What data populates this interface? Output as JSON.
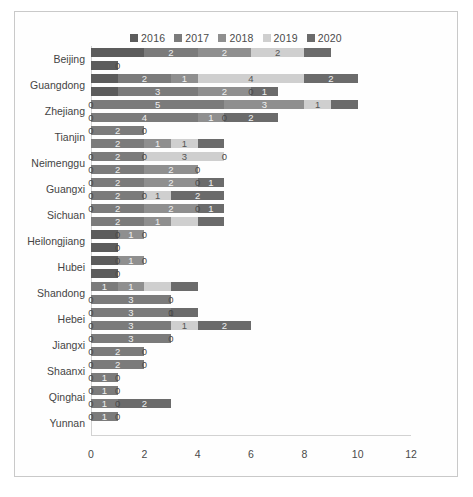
{
  "chart": {
    "type": "bar",
    "orientation": "horizontal",
    "stacked": true,
    "title": "",
    "xlabel": "",
    "ylabel": "",
    "xlim": [
      0,
      12
    ],
    "xticks": [
      0,
      2,
      4,
      6,
      8,
      10,
      12
    ],
    "grid": false,
    "legend_position": "top-center",
    "bars_per_group": 2,
    "value_label_zero_shown": true
  },
  "legend": {
    "items": [
      {
        "label": "2016",
        "color": "#5c5c5c"
      },
      {
        "label": "2017",
        "color": "#7b7b7b"
      },
      {
        "label": "2018",
        "color": "#8f8f8f"
      },
      {
        "label": "2019",
        "color": "#cfcfcf"
      },
      {
        "label": "2020",
        "color": "#6b6b6b"
      }
    ]
  },
  "series_colors": [
    "#5c5c5c",
    "#7b7b7b",
    "#8f8f8f",
    "#cfcfcf",
    "#6b6b6b"
  ],
  "series_names": [
    "2016",
    "2017",
    "2018",
    "2019",
    "2020"
  ],
  "chart_data": {
    "type": "bar",
    "orientation": "horizontal",
    "stacked": true,
    "title": "",
    "xlabel": "",
    "ylabel": "",
    "xlim": [
      0,
      12
    ],
    "xticks": [
      0,
      2,
      4,
      6,
      8,
      10,
      12
    ],
    "grid": false,
    "legend": [
      "2016",
      "2017",
      "2018",
      "2019",
      "2020"
    ],
    "categories": [
      "Beijing",
      "Guangdong",
      "Zhejiang",
      "Tianjin",
      "Neimenggu",
      "Guangxi",
      "Sichuan",
      "Heilongjiang",
      "Hubei",
      "Shandong",
      "Hebei",
      "Jiangxi",
      "Shaanxi",
      "Qinghai",
      "Yunnan"
    ],
    "groups": [
      {
        "category": "Beijing",
        "bars": [
          {
            "values": [
              2,
              2,
              2,
              2,
              1
            ],
            "labels": [
              "",
              "2",
              "2",
              "2",
              ""
            ],
            "total": 9
          },
          {
            "values": [
              1,
              0,
              0,
              0,
              0
            ],
            "labels": [
              "",
              "0",
              "",
              "",
              ""
            ],
            "total": 1
          }
        ]
      },
      {
        "category": "Guangdong",
        "bars": [
          {
            "values": [
              1,
              2,
              1,
              4,
              2
            ],
            "labels": [
              "",
              "2",
              "1",
              "4",
              "2"
            ],
            "total": 10
          },
          {
            "values": [
              1,
              3,
              2,
              0,
              1
            ],
            "labels": [
              "",
              "3",
              "2",
              "0",
              "1"
            ],
            "total": 7
          }
        ]
      },
      {
        "category": "Zhejiang",
        "bars": [
          {
            "values": [
              0,
              5,
              3,
              1,
              1
            ],
            "labels": [
              "0",
              "5",
              "3",
              "1",
              ""
            ],
            "total": 10
          },
          {
            "values": [
              0,
              4,
              1,
              0,
              2
            ],
            "labels": [
              "0",
              "4",
              "1",
              "0",
              "2"
            ],
            "total": 7
          }
        ]
      },
      {
        "category": "Tianjin",
        "bars": [
          {
            "values": [
              0,
              2,
              0,
              0,
              0
            ],
            "labels": [
              "0",
              "2",
              "0",
              "",
              ""
            ],
            "total": 2
          },
          {
            "values": [
              0,
              2,
              1,
              1,
              1
            ],
            "labels": [
              "",
              "2",
              "1",
              "1",
              ""
            ],
            "total": 5
          }
        ]
      },
      {
        "category": "Neimenggu",
        "bars": [
          {
            "values": [
              0,
              2,
              0,
              3,
              0
            ],
            "labels": [
              "0",
              "2",
              "0",
              "3",
              "0"
            ],
            "total": 5
          },
          {
            "values": [
              0,
              2,
              2,
              0,
              0
            ],
            "labels": [
              "0",
              "2",
              "2",
              "0",
              ""
            ],
            "total": 4
          }
        ]
      },
      {
        "category": "Guangxi",
        "bars": [
          {
            "values": [
              0,
              2,
              2,
              0,
              1
            ],
            "labels": [
              "0",
              "2",
              "2",
              "0",
              "1"
            ],
            "total": 5
          },
          {
            "values": [
              0,
              2,
              0,
              1,
              2
            ],
            "labels": [
              "0",
              "2",
              "0",
              "1",
              "2"
            ],
            "total": 5
          }
        ]
      },
      {
        "category": "Sichuan",
        "bars": [
          {
            "values": [
              0,
              2,
              2,
              0,
              1
            ],
            "labels": [
              "0",
              "2",
              "2",
              "0",
              "1"
            ],
            "total": 5
          },
          {
            "values": [
              0,
              2,
              1,
              1,
              1
            ],
            "labels": [
              "",
              "2",
              "1",
              "",
              ""
            ],
            "total": 5
          }
        ]
      },
      {
        "category": "Heilongjiang",
        "bars": [
          {
            "values": [
              1,
              0,
              1,
              0,
              0
            ],
            "labels": [
              "",
              "0",
              "1",
              "0",
              ""
            ],
            "total": 2
          },
          {
            "values": [
              1,
              0,
              0,
              0,
              0
            ],
            "labels": [
              "",
              "0",
              "",
              "",
              ""
            ],
            "total": 1
          }
        ]
      },
      {
        "category": "Hubei",
        "bars": [
          {
            "values": [
              1,
              0,
              1,
              0,
              0
            ],
            "labels": [
              "",
              "0",
              "1",
              "0",
              ""
            ],
            "total": 2
          },
          {
            "values": [
              1,
              0,
              0,
              0,
              0
            ],
            "labels": [
              "",
              "0",
              "",
              "",
              ""
            ],
            "total": 1
          }
        ]
      },
      {
        "category": "Shandong",
        "bars": [
          {
            "values": [
              0,
              1,
              1,
              1,
              1
            ],
            "labels": [
              "",
              "1",
              "1",
              "",
              ""
            ],
            "total": 4
          },
          {
            "values": [
              0,
              3,
              0,
              0,
              0
            ],
            "labels": [
              "0",
              "3",
              "0",
              "",
              ""
            ],
            "total": 3
          }
        ]
      },
      {
        "category": "Hebei",
        "bars": [
          {
            "values": [
              0,
              3,
              0,
              0,
              1
            ],
            "labels": [
              "0",
              "3",
              "0",
              "1",
              ""
            ],
            "total": 4
          },
          {
            "values": [
              0,
              3,
              0,
              1,
              2
            ],
            "labels": [
              "0",
              "3",
              "",
              "1",
              "2"
            ],
            "total": 6
          }
        ]
      },
      {
        "category": "Jiangxi",
        "bars": [
          {
            "values": [
              0,
              3,
              0,
              0,
              0
            ],
            "labels": [
              "0",
              "3",
              "0",
              "",
              ""
            ],
            "total": 3
          },
          {
            "values": [
              0,
              2,
              0,
              0,
              0
            ],
            "labels": [
              "0",
              "2",
              "0",
              "",
              ""
            ],
            "total": 2
          }
        ]
      },
      {
        "category": "Shaanxi",
        "bars": [
          {
            "values": [
              0,
              2,
              0,
              0,
              0
            ],
            "labels": [
              "0",
              "2",
              "0",
              "",
              ""
            ],
            "total": 2
          },
          {
            "values": [
              0,
              1,
              0,
              0,
              0
            ],
            "labels": [
              "0",
              "1",
              "0",
              "",
              ""
            ],
            "total": 1
          }
        ]
      },
      {
        "category": "Qinghai",
        "bars": [
          {
            "values": [
              0,
              1,
              0,
              0,
              0
            ],
            "labels": [
              "0",
              "1",
              "0",
              "",
              ""
            ],
            "total": 1
          },
          {
            "values": [
              0,
              1,
              0,
              0,
              2
            ],
            "labels": [
              "0",
              "1",
              "0",
              "",
              "2"
            ],
            "total": 4
          }
        ]
      },
      {
        "category": "Yunnan",
        "bars": [
          {
            "values": [
              0,
              1,
              0,
              0,
              0
            ],
            "labels": [
              "0",
              "1",
              "0",
              "",
              ""
            ],
            "total": 1
          },
          {
            "values": [
              0,
              0,
              0,
              0,
              0
            ],
            "labels": [
              "",
              "",
              "",
              "",
              ""
            ],
            "total": 0
          }
        ]
      }
    ]
  }
}
